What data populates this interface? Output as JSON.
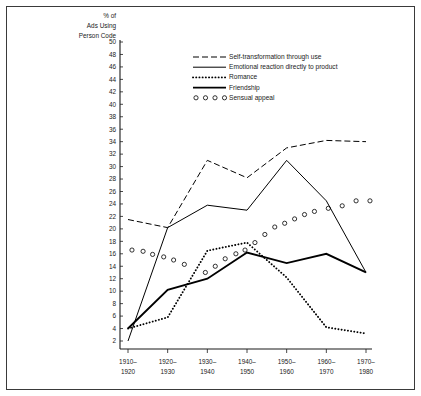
{
  "figure": {
    "border_color": "#3a3a3a",
    "background": "#ffffff"
  },
  "chart_data": {
    "type": "line",
    "title": "",
    "ylabel_lines": [
      "% of",
      "Ads Using",
      "Person Code"
    ],
    "ylabel": "% of Ads Using Person Code",
    "xlabel": "",
    "grid": false,
    "legend_position": "upper-center",
    "ylim": [
      0,
      50
    ],
    "yticks": [
      2,
      4,
      6,
      8,
      10,
      12,
      14,
      16,
      18,
      20,
      22,
      24,
      26,
      28,
      30,
      32,
      34,
      36,
      38,
      40,
      42,
      44,
      46,
      48,
      50
    ],
    "categories": [
      "1910–\n1920",
      "1920–\n1930",
      "1930–\n1940",
      "1940–\n1950",
      "1950–\n1960",
      "1960–\n1970",
      "1970–\n1980"
    ],
    "xtick_labels_top": [
      "1910–",
      "1920–",
      "1930–",
      "1940–",
      "1950–",
      "1960–",
      "1970–"
    ],
    "xtick_labels_bottom": [
      "1920",
      "1930",
      "1940",
      "1950",
      "1960",
      "1970",
      "1980"
    ],
    "series": [
      {
        "name": "Self-transformation through use",
        "style": "dashed",
        "values": [
          21.5,
          20.2,
          31.0,
          28.2,
          33.0,
          34.2,
          34.0
        ]
      },
      {
        "name": "Emotional reaction directly to product",
        "style": "solid",
        "values": [
          2.0,
          20.2,
          23.8,
          23.0,
          31.0,
          24.5,
          13.0
        ]
      },
      {
        "name": "Romance",
        "style": "dotted",
        "values": [
          4.0,
          5.8,
          16.5,
          17.8,
          12.2,
          4.2,
          3.2
        ]
      },
      {
        "name": "Friendship",
        "style": "thick",
        "values": [
          4.0,
          10.2,
          12.0,
          16.2,
          14.5,
          16.0,
          13.0
        ]
      },
      {
        "name": "Sensual appeal",
        "style": "circles",
        "marker_x": [
          0.1,
          0.38,
          0.62,
          0.9,
          1.15,
          1.42,
          1.95,
          2.2,
          2.45,
          2.72,
          2.95,
          3.2,
          3.45,
          3.7,
          3.95,
          4.2,
          4.45,
          4.7,
          5.05,
          5.4,
          5.75,
          6.1
        ],
        "marker_y": [
          16.6,
          16.4,
          15.9,
          15.5,
          15.0,
          14.3,
          13.0,
          14.0,
          15.2,
          16.0,
          16.6,
          17.8,
          19.1,
          20.3,
          20.9,
          21.6,
          22.3,
          22.8,
          23.3,
          23.7,
          24.5,
          24.5
        ]
      }
    ],
    "legend": [
      {
        "label": "Self-transformation through use",
        "style": "dashed"
      },
      {
        "label": "Emotional reaction directly to product",
        "style": "solid"
      },
      {
        "label": "Romance",
        "style": "dotted"
      },
      {
        "label": "Friendship",
        "style": "thick"
      },
      {
        "label": "Sensual appeal",
        "style": "circles"
      }
    ]
  }
}
